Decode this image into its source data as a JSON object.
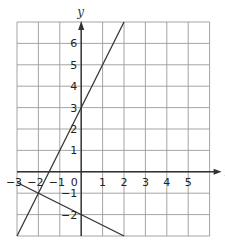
{
  "chart_data": {
    "type": "line",
    "title": "",
    "xlabel": "x",
    "ylabel": "y",
    "xlim": [
      -3,
      6
    ],
    "ylim": [
      -3,
      7
    ],
    "grid": true,
    "x_ticks": [
      "-3",
      "-2",
      "-1",
      "0",
      "1",
      "2",
      "3",
      "4",
      "5"
    ],
    "y_ticks": [
      "-2",
      "-1",
      "1",
      "2",
      "3",
      "4",
      "5",
      "6"
    ],
    "series": [
      {
        "name": "line-a",
        "equation": "y = 2x + 3",
        "x": [
          -3,
          2
        ],
        "y": [
          -3,
          7
        ]
      },
      {
        "name": "line-b",
        "equation": "y = -0.5x - 2",
        "x": [
          -3,
          2
        ],
        "y": [
          -0.5,
          -3
        ]
      }
    ],
    "intersection": {
      "x": -2,
      "y": -1
    },
    "colors": {
      "grid": "#9a9a9a",
      "axis": "#333333",
      "line": "#333333"
    }
  }
}
